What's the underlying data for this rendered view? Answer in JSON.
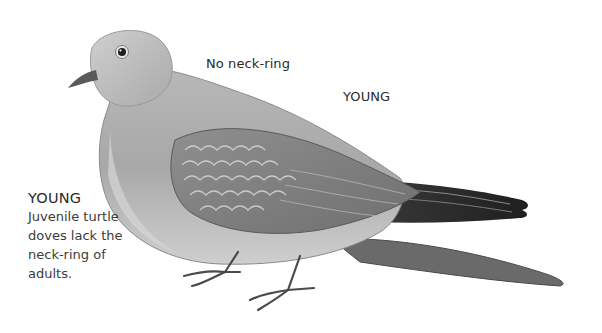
{
  "illustration": {
    "subject": "juvenile turtle dove",
    "palette": {
      "background": "#ffffff",
      "plumage_light": "#c9c9c9",
      "plumage_mid": "#9a9a9a",
      "plumage_dark": "#4a4a4a",
      "tail_dark": "#2b2b2b",
      "text": "#2a2a2a"
    }
  },
  "annotations": {
    "neck_label": "No neck-ring",
    "body_label": "YOUNG"
  },
  "caption": {
    "title": "YOUNG",
    "lines": [
      "Juvenile turtle",
      "doves lack the",
      "neck-ring of",
      "adults."
    ]
  }
}
